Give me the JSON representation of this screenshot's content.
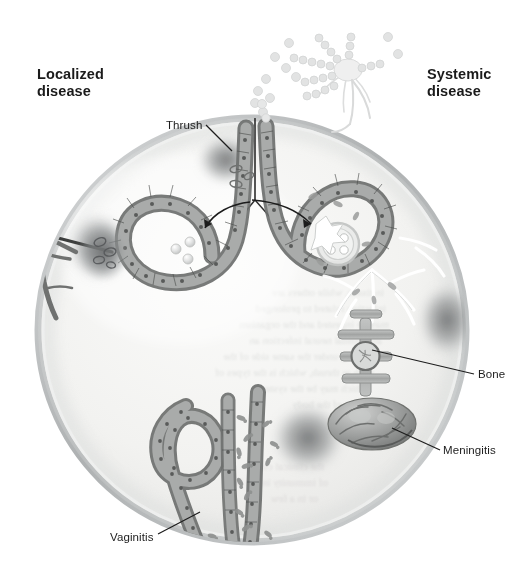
{
  "figure": {
    "title_left": "Localized\ndisease",
    "title_right": "Systemic\ndisease",
    "background_color": "#ffffff",
    "body_outline_color": "#b9bcbd",
    "body_fill_color": "#f1f1ef",
    "epithelium_color": "#8a8c8b",
    "lead_line_color": "#1d1d1d",
    "label_text_color": "#1d1d1d"
  },
  "headers": [
    {
      "id": "localized",
      "label": "Localized\ndisease",
      "side": "left"
    },
    {
      "id": "systemic",
      "label": "Systemic\ndisease",
      "side": "right"
    }
  ],
  "callouts": [
    {
      "id": "thrush",
      "label": "Thrush",
      "side": "left",
      "target": "oral mucosa epithelium"
    },
    {
      "id": "bone",
      "label": "Bone",
      "side": "right",
      "target": "vertebra"
    },
    {
      "id": "meningitis",
      "label": "Meningitis",
      "side": "right",
      "target": "brain"
    },
    {
      "id": "vaginitis",
      "label": "Vaginitis",
      "side": "left",
      "target": "vaginal mucosa"
    }
  ],
  "structures": [
    {
      "id": "body-circle",
      "name": "body-outline-circle"
    },
    {
      "id": "conidiophore",
      "name": "fungal-conidiophore-spore-chains"
    },
    {
      "id": "airborne-spores",
      "name": "airborne-spores"
    },
    {
      "id": "thorn",
      "name": "thorn-traumatic-inoculation"
    },
    {
      "id": "skin-lesion",
      "name": "skin-lesion"
    },
    {
      "id": "trachea-line",
      "name": "central-airway-line"
    },
    {
      "id": "left-alveolus",
      "name": "alveolus-with-spores"
    },
    {
      "id": "right-alveolus",
      "name": "alveolus-with-spherule-endospores"
    },
    {
      "id": "spherule",
      "name": "spherule-with-endospores"
    },
    {
      "id": "vessels",
      "name": "blood-vessels-dissemination"
    },
    {
      "id": "vertebra",
      "name": "vertebra-bone"
    },
    {
      "id": "brain",
      "name": "brain-meninges"
    },
    {
      "id": "vaginal-tract",
      "name": "vaginal-tract-epithelium"
    },
    {
      "id": "yeast-cells",
      "name": "budding-yeast-cells"
    },
    {
      "id": "organ-lesions",
      "name": "disseminated-organ-lesions"
    }
  ]
}
